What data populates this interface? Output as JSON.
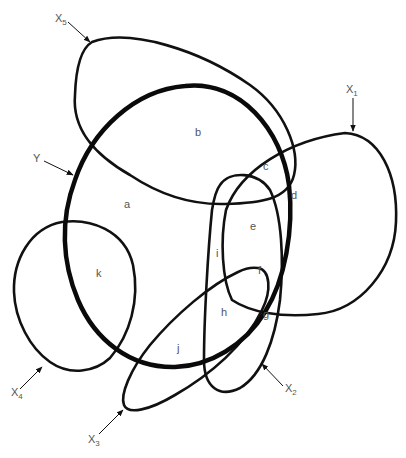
{
  "diagram": {
    "type": "set-overlap-diagram",
    "stroke_color": "#111111",
    "label_color": "#555555",
    "sets": [
      {
        "id": "Y",
        "label": "Y",
        "sub": "",
        "emphasis": "thick"
      },
      {
        "id": "X1",
        "label": "X",
        "sub": "1"
      },
      {
        "id": "X2",
        "label": "X",
        "sub": "2"
      },
      {
        "id": "X3",
        "label": "X",
        "sub": "3"
      },
      {
        "id": "X4",
        "label": "X",
        "sub": "4"
      },
      {
        "id": "X5",
        "label": "X",
        "sub": "5"
      }
    ],
    "regions": [
      {
        "id": "a",
        "label": "a"
      },
      {
        "id": "b",
        "label": "b"
      },
      {
        "id": "c",
        "label": "c"
      },
      {
        "id": "d",
        "label": "d"
      },
      {
        "id": "e",
        "label": "e"
      },
      {
        "id": "f",
        "label": "f"
      },
      {
        "id": "g",
        "label": "g"
      },
      {
        "id": "h",
        "label": "h"
      },
      {
        "id": "i",
        "label": "i"
      },
      {
        "id": "j",
        "label": "j"
      },
      {
        "id": "k",
        "label": "k"
      }
    ]
  }
}
